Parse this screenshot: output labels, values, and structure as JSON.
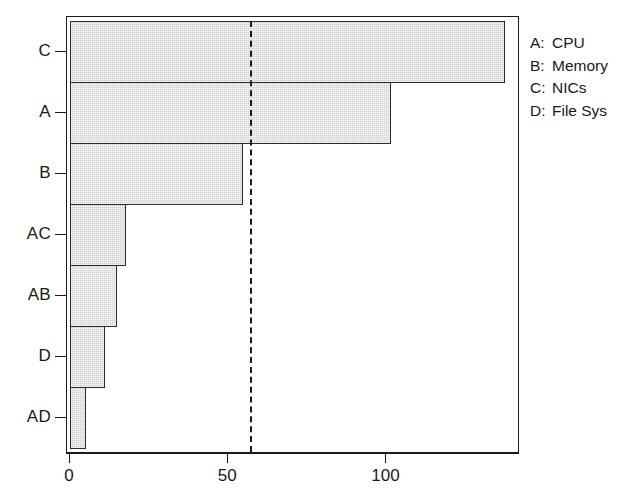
{
  "chart_data": {
    "type": "bar",
    "orientation": "horizontal",
    "title": "",
    "xlabel": "",
    "ylabel": "",
    "categories": [
      "C",
      "A",
      "B",
      "AC",
      "AB",
      "D",
      "AD"
    ],
    "values": [
      138,
      102,
      55,
      17.7,
      15,
      11,
      5
    ],
    "xlim": [
      0,
      140
    ],
    "ylim": [
      0,
      7
    ],
    "xticks": [
      0,
      50,
      100
    ],
    "xticklabels": [
      "0",
      "50",
      "100"
    ],
    "grid": false,
    "bars_touching": true,
    "bar_fill_color": "#d2d2d2",
    "bar_edge_color": "#2b2b2b",
    "annotations": [
      {
        "name": "reference-line",
        "type": "vertical-dashed-line",
        "x": 57,
        "color": "#1a1a1a",
        "linestyle": "dashed"
      }
    ],
    "legend": {
      "position": "right",
      "entries": [
        {
          "key": "A:",
          "name": "CPU"
        },
        {
          "key": "B:",
          "name": "Memory"
        },
        {
          "key": "C:",
          "name": "NICs"
        },
        {
          "key": "D:",
          "name": "File Sys"
        }
      ]
    }
  },
  "axes": {
    "y_labels": [
      "C",
      "A",
      "B",
      "AC",
      "AB",
      "D",
      "AD"
    ],
    "x_tick_labels": [
      "0",
      "50",
      "100"
    ]
  }
}
